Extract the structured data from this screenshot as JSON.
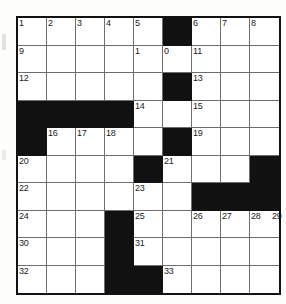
{
  "puzzle": {
    "type": "crossword-grid",
    "columns": 9,
    "rows": 10,
    "cell_size_px": 29,
    "grid_origin": {
      "x": 16,
      "y": 16
    },
    "colors": {
      "block": "#111111",
      "cell": "#ffffff",
      "gridline": "#6e6e6e",
      "border": "#111111",
      "number": "#1a1a1a"
    },
    "clue_numbers_visible": [
      "1",
      "2",
      "3",
      "4",
      "5",
      "6",
      "7",
      "8",
      "9",
      "1",
      "0",
      "11",
      "12",
      "13",
      "14",
      "15",
      "16",
      "17",
      "18",
      "19",
      "20",
      "21",
      "22",
      "23",
      "24",
      "25",
      "26",
      "27",
      "28",
      "29",
      "30",
      "31",
      "32",
      "33"
    ],
    "cells": [
      [
        {
          "block": false,
          "num": "1"
        },
        {
          "block": false,
          "num": "2"
        },
        {
          "block": false,
          "num": "3"
        },
        {
          "block": false,
          "num": "4"
        },
        {
          "block": false,
          "num": "5"
        },
        {
          "block": true,
          "num": ""
        },
        {
          "block": false,
          "num": "6"
        },
        {
          "block": false,
          "num": "7"
        },
        {
          "block": false,
          "num": "8"
        }
      ],
      [
        {
          "block": false,
          "num": "9"
        },
        {
          "block": false,
          "num": ""
        },
        {
          "block": false,
          "num": ""
        },
        {
          "block": false,
          "num": ""
        },
        {
          "block": false,
          "num": "1"
        },
        {
          "block": false,
          "num": "0"
        },
        {
          "block": false,
          "num": "11"
        },
        {
          "block": false,
          "num": ""
        },
        {
          "block": false,
          "num": ""
        }
      ],
      [
        {
          "block": false,
          "num": "12"
        },
        {
          "block": false,
          "num": ""
        },
        {
          "block": false,
          "num": ""
        },
        {
          "block": false,
          "num": ""
        },
        {
          "block": false,
          "num": ""
        },
        {
          "block": true,
          "num": ""
        },
        {
          "block": false,
          "num": "13"
        },
        {
          "block": false,
          "num": ""
        },
        {
          "block": false,
          "num": ""
        }
      ],
      [
        {
          "block": true,
          "num": ""
        },
        {
          "block": true,
          "num": ""
        },
        {
          "block": true,
          "num": ""
        },
        {
          "block": true,
          "num": ""
        },
        {
          "block": false,
          "num": "14"
        },
        {
          "block": false,
          "num": ""
        },
        {
          "block": false,
          "num": "15"
        },
        {
          "block": false,
          "num": ""
        },
        {
          "block": false,
          "num": ""
        }
      ],
      [
        {
          "block": true,
          "num": ""
        },
        {
          "block": false,
          "num": "16"
        },
        {
          "block": false,
          "num": "17"
        },
        {
          "block": false,
          "num": "18"
        },
        {
          "block": false,
          "num": ""
        },
        {
          "block": true,
          "num": ""
        },
        {
          "block": false,
          "num": "19"
        },
        {
          "block": false,
          "num": ""
        },
        {
          "block": false,
          "num": ""
        }
      ],
      [
        {
          "block": false,
          "num": "20"
        },
        {
          "block": false,
          "num": ""
        },
        {
          "block": false,
          "num": ""
        },
        {
          "block": false,
          "num": ""
        },
        {
          "block": true,
          "num": ""
        },
        {
          "block": false,
          "num": "21"
        },
        {
          "block": false,
          "num": ""
        },
        {
          "block": false,
          "num": ""
        },
        {
          "block": true,
          "num": ""
        }
      ],
      [
        {
          "block": false,
          "num": "22"
        },
        {
          "block": false,
          "num": ""
        },
        {
          "block": false,
          "num": ""
        },
        {
          "block": false,
          "num": ""
        },
        {
          "block": false,
          "num": "23"
        },
        {
          "block": false,
          "num": ""
        },
        {
          "block": true,
          "num": ""
        },
        {
          "block": true,
          "num": ""
        },
        {
          "block": true,
          "num": ""
        }
      ],
      [
        {
          "block": false,
          "num": "24"
        },
        {
          "block": false,
          "num": ""
        },
        {
          "block": false,
          "num": ""
        },
        {
          "block": true,
          "num": ""
        },
        {
          "block": false,
          "num": "25"
        },
        {
          "block": false,
          "num": ""
        },
        {
          "block": false,
          "num": "26"
        },
        {
          "block": false,
          "num": "27"
        },
        {
          "block": false,
          "num": "28"
        }
      ],
      [
        {
          "block": false,
          "num": "30"
        },
        {
          "block": false,
          "num": ""
        },
        {
          "block": false,
          "num": ""
        },
        {
          "block": true,
          "num": ""
        },
        {
          "block": false,
          "num": "31"
        },
        {
          "block": false,
          "num": ""
        },
        {
          "block": false,
          "num": ""
        },
        {
          "block": false,
          "num": ""
        },
        {
          "block": false,
          "num": ""
        }
      ],
      [
        {
          "block": false,
          "num": "32"
        },
        {
          "block": false,
          "num": ""
        },
        {
          "block": false,
          "num": ""
        },
        {
          "block": true,
          "num": ""
        },
        {
          "block": true,
          "num": ""
        },
        {
          "block": false,
          "num": "33"
        },
        {
          "block": false,
          "num": ""
        },
        {
          "block": false,
          "num": ""
        },
        {
          "block": false,
          "num": ""
        }
      ]
    ],
    "extra_numbers": [
      {
        "row": 7,
        "col": 8,
        "num": "29",
        "offset": true
      }
    ]
  }
}
